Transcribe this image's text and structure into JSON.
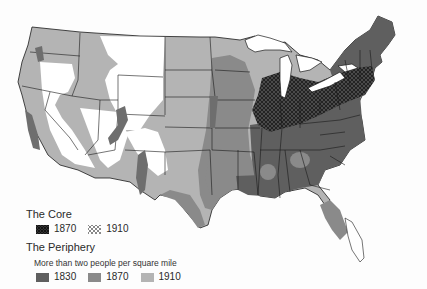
{
  "map": {
    "subject": "United States population density core and periphery",
    "colors": {
      "background": "#fdfdfd",
      "periphery_1830": "#5f5f5f",
      "periphery_1870": "#8a8a8a",
      "periphery_1910": "#b4b4b4",
      "unsettled": "#ffffff",
      "borders": "#1a1a1a",
      "core_hatch": "#2a2a2a"
    }
  },
  "legend": {
    "core": {
      "title": "The Core",
      "items": [
        {
          "label": "1870",
          "pattern": "dense-crosshatch"
        },
        {
          "label": "1910",
          "pattern": "light-crosshatch"
        }
      ]
    },
    "periphery": {
      "title": "The Periphery",
      "subtitle": "More than two people per square mile",
      "items": [
        {
          "label": "1830",
          "color": "#5f5f5f"
        },
        {
          "label": "1870",
          "color": "#8a8a8a"
        },
        {
          "label": "1910",
          "color": "#b4b4b4"
        }
      ]
    }
  }
}
